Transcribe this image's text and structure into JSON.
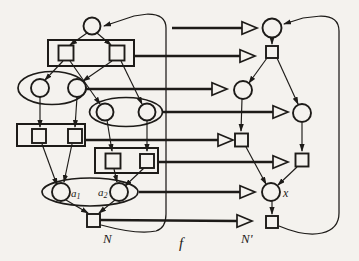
{
  "figure": {
    "kind": "graph-morphism-diagram",
    "colors": {
      "paper": "#f4f2ee",
      "ink": "#1d1b18"
    },
    "left_tree": {
      "name_label": "N",
      "leaf_a1": {
        "base": "a",
        "sub": "1"
      },
      "leaf_a2": {
        "base": "a",
        "sub": "2"
      }
    },
    "right_tree": {
      "name_label": "N'",
      "node_x_label": "x"
    },
    "morphism": {
      "label": "f"
    }
  }
}
